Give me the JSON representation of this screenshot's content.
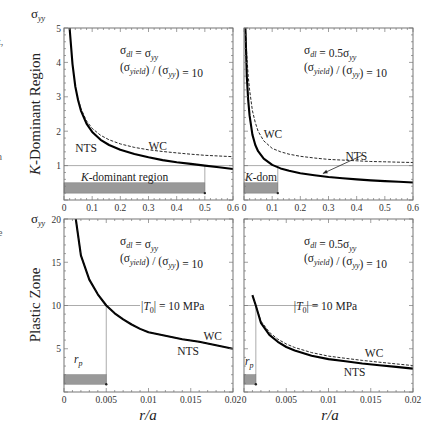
{
  "figure": {
    "row_labels": [
      "K-Dominant Region",
      "Plastic Zone"
    ],
    "row_labels_italic_prefix": [
      "K",
      ""
    ],
    "x_axis_label": "r/a",
    "y_axis_label": "σ",
    "y_axis_label_sub": "yy",
    "edge_fragments": [
      "t,",
      "n",
      "e"
    ]
  },
  "chart_data": [
    {
      "id": "k-dominant-left",
      "type": "line",
      "row": "K-Dominant Region",
      "annotation_line1": "σ_dl = σ_yy",
      "annotation_line2": "(σ_yield) / (σ_yy) = 10",
      "xlim": [
        0,
        0.6
      ],
      "ylim": [
        0,
        5
      ],
      "xticks": [
        0,
        0.1,
        0.2,
        0.3,
        0.4,
        0.5,
        0.6
      ],
      "xticklabels": [
        "0",
        "0.1",
        "0.2",
        "0.3",
        "0.4",
        "0.5",
        "0.6"
      ],
      "yticks": [
        1,
        2,
        3,
        4,
        5
      ],
      "yticklabels": [
        "1",
        "2",
        "3",
        "4",
        "5"
      ],
      "reference_line_y": 1,
      "region_bar": {
        "x0": 0,
        "x1": 0.5,
        "y0": 0.2,
        "y1": 0.5,
        "label": "K-dominant region"
      },
      "series": [
        {
          "name": "NTS",
          "style": "solid-thick",
          "x": [
            0.02,
            0.03,
            0.04,
            0.05,
            0.06,
            0.08,
            0.1,
            0.13,
            0.16,
            0.2,
            0.25,
            0.3,
            0.35,
            0.4,
            0.45,
            0.5,
            0.55,
            0.6
          ],
          "y": [
            5.0,
            3.95,
            3.3,
            2.9,
            2.6,
            2.22,
            1.98,
            1.75,
            1.6,
            1.46,
            1.34,
            1.24,
            1.16,
            1.1,
            1.05,
            1.0,
            0.95,
            0.9
          ]
        },
        {
          "name": "WC",
          "style": "dashed",
          "x": [
            0.05,
            0.06,
            0.08,
            0.1,
            0.13,
            0.16,
            0.2,
            0.25,
            0.3,
            0.35,
            0.4,
            0.45,
            0.5,
            0.55,
            0.6
          ],
          "y": [
            2.95,
            2.66,
            2.3,
            2.08,
            1.88,
            1.75,
            1.63,
            1.53,
            1.46,
            1.41,
            1.37,
            1.33,
            1.3,
            1.28,
            1.26
          ]
        }
      ],
      "curve_labels": [
        {
          "text": "NTS",
          "x": 0.04,
          "y": 1.4
        },
        {
          "text": "WC",
          "x": 0.3,
          "y": 1.45
        }
      ]
    },
    {
      "id": "k-dominant-right",
      "type": "line",
      "row": "K-Dominant Region",
      "annotation_line1": "σ_dl = 0.5σ_yy",
      "annotation_line2": "(σ_yield) / (σ_yy) = 10",
      "xlim": [
        0,
        0.6
      ],
      "ylim": [
        0,
        5
      ],
      "xticks": [
        0,
        0.1,
        0.2,
        0.3,
        0.4,
        0.5,
        0.6
      ],
      "xticklabels": [
        "0",
        "0.1",
        "0.2",
        "0.3",
        "0.4",
        "0.5",
        "0.6"
      ],
      "yticks": [
        1,
        2,
        3,
        4,
        5
      ],
      "yticklabels": [],
      "reference_line_y": 1,
      "region_bar": {
        "x0": 0,
        "x1": 0.12,
        "y0": 0.2,
        "y1": 0.5,
        "label": "K-dom"
      },
      "series": [
        {
          "name": "NTS",
          "style": "solid-thick",
          "x": [
            0.005,
            0.01,
            0.015,
            0.02,
            0.03,
            0.04,
            0.05,
            0.07,
            0.1,
            0.13,
            0.16,
            0.2,
            0.25,
            0.3,
            0.35,
            0.4,
            0.45,
            0.5,
            0.55,
            0.6
          ],
          "y": [
            5.0,
            3.6,
            2.9,
            2.45,
            1.9,
            1.6,
            1.42,
            1.2,
            1.02,
            0.92,
            0.85,
            0.78,
            0.72,
            0.67,
            0.63,
            0.6,
            0.57,
            0.55,
            0.53,
            0.51
          ]
        },
        {
          "name": "WC",
          "style": "dashed",
          "x": [
            0.005,
            0.01,
            0.015,
            0.02,
            0.03,
            0.04,
            0.05,
            0.07,
            0.1,
            0.13,
            0.16,
            0.2,
            0.25,
            0.3,
            0.35,
            0.4,
            0.45,
            0.5,
            0.55,
            0.6
          ],
          "y": [
            5.0,
            4.2,
            3.6,
            3.2,
            2.6,
            2.25,
            2.0,
            1.72,
            1.5,
            1.4,
            1.33,
            1.27,
            1.22,
            1.18,
            1.16,
            1.14,
            1.12,
            1.11,
            1.1,
            1.09
          ]
        }
      ],
      "curve_labels": [
        {
          "text": "WC",
          "x": 0.07,
          "y": 1.8
        },
        {
          "text": "NTS",
          "x": 0.36,
          "y": 1.17
        }
      ],
      "arrow": {
        "from": [
          0.42,
          1.3
        ],
        "to": [
          0.28,
          0.77
        ]
      }
    },
    {
      "id": "plastic-zone-left",
      "type": "line",
      "row": "Plastic Zone",
      "annotation_line1": "σ_dl = σ_yy",
      "annotation_line2": "(σ_yield) / (σ_yy) = 10",
      "annotation_t0": "|T_0| = 10 MPa",
      "xlim": [
        0,
        0.02
      ],
      "ylim": [
        0,
        20
      ],
      "xticks": [
        0,
        0.005,
        0.01,
        0.015,
        0.02
      ],
      "xticklabels": [
        "0",
        "0.005",
        "0.01",
        "0.015",
        "0.02"
      ],
      "yticks": [
        5,
        10,
        15,
        20
      ],
      "yticklabels": [
        "5",
        "10",
        "15",
        "20"
      ],
      "reference_line_y": 10,
      "rp_x": 0.005,
      "region_bar": {
        "x0": 0,
        "x1": 0.005,
        "y0": 0.9,
        "y1": 2.0,
        "label": "r_p"
      },
      "series": [
        {
          "name": "NTS",
          "style": "solid-thick",
          "x": [
            0.0014,
            0.002,
            0.003,
            0.004,
            0.005,
            0.006,
            0.007,
            0.008,
            0.009,
            0.01,
            0.012,
            0.014,
            0.016,
            0.018,
            0.02
          ],
          "y": [
            20,
            15.8,
            13.0,
            11.3,
            10.0,
            9.1,
            8.4,
            7.8,
            7.3,
            6.9,
            6.5,
            6.1,
            5.8,
            5.4,
            5.0
          ]
        },
        {
          "name": "WC",
          "style": "dashed",
          "x": [
            0.0014,
            0.002,
            0.003,
            0.004,
            0.005,
            0.006,
            0.007,
            0.008,
            0.009,
            0.01,
            0.012,
            0.014,
            0.016,
            0.018,
            0.02
          ],
          "y": [
            20,
            15.8,
            13.0,
            11.3,
            10.0,
            9.1,
            8.4,
            7.8,
            7.3,
            6.9,
            6.5,
            6.1,
            5.8,
            5.4,
            5.0
          ]
        }
      ],
      "curve_labels": [
        {
          "text": "WC",
          "x": 0.0165,
          "y": 6.0
        },
        {
          "text": "NTS",
          "x": 0.0134,
          "y": 4.3
        }
      ]
    },
    {
      "id": "plastic-zone-right",
      "type": "line",
      "row": "Plastic Zone",
      "annotation_line1": "σ_dl = 0.5σ_yy",
      "annotation_line2": "(σ_yield) / (σ_yy) = 10",
      "annotation_t0": "|T_0| = 10 MPa",
      "xlim": [
        0,
        0.02
      ],
      "ylim": [
        0,
        20
      ],
      "xticks": [
        0,
        0.005,
        0.01,
        0.015,
        0.02
      ],
      "xticklabels": [
        "0",
        "0.005",
        "0.01",
        "0.015",
        "0.02"
      ],
      "yticks": [
        5,
        10,
        15,
        20
      ],
      "yticklabels": [],
      "reference_line_y": 10,
      "rp_x": 0.0014,
      "region_bar": {
        "x0": 0,
        "x1": 0.0014,
        "y0": 0.9,
        "y1": 2.0,
        "label": "r_p"
      },
      "series": [
        {
          "name": "NTS",
          "style": "solid-thick",
          "x": [
            0.001,
            0.0014,
            0.002,
            0.003,
            0.004,
            0.005,
            0.006,
            0.008,
            0.01,
            0.012,
            0.014,
            0.016,
            0.018,
            0.02
          ],
          "y": [
            11.2,
            10.0,
            8.0,
            6.6,
            5.8,
            5.2,
            4.8,
            4.2,
            3.8,
            3.55,
            3.3,
            3.1,
            2.9,
            2.7
          ]
        },
        {
          "name": "WC",
          "style": "dashed",
          "x": [
            0.001,
            0.0014,
            0.002,
            0.003,
            0.004,
            0.005,
            0.006,
            0.008,
            0.01,
            0.012,
            0.014,
            0.016,
            0.018,
            0.02
          ],
          "y": [
            11.2,
            10.0,
            8.2,
            6.9,
            6.1,
            5.55,
            5.15,
            4.55,
            4.15,
            3.9,
            3.65,
            3.45,
            3.25,
            3.05
          ]
        }
      ],
      "curve_labels": [
        {
          "text": "WC",
          "x": 0.0143,
          "y": 4.1
        },
        {
          "text": "NTS",
          "x": 0.0118,
          "y": 1.9
        }
      ]
    }
  ]
}
